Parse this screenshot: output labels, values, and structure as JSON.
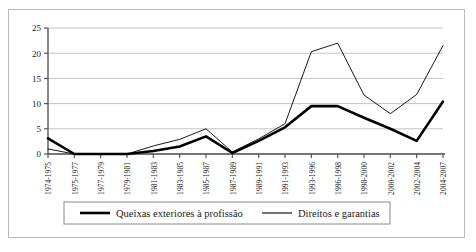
{
  "chart_data": {
    "type": "line",
    "title": "",
    "xlabel": "",
    "ylabel": "",
    "ylim": [
      0,
      25
    ],
    "yticks": [
      0,
      5,
      10,
      15,
      20,
      25
    ],
    "grid": true,
    "legend_position": "bottom",
    "categories": [
      "1974-1975",
      "1975-1977",
      "1977-1979",
      "1979-1981",
      "1981-1983",
      "1983-1985",
      "1985-1987",
      "1987-1989",
      "1989-1991",
      "1991-1993",
      "1993-1996",
      "1996-1998",
      "1998-2000",
      "2000-2002",
      "2002-2004",
      "2004-2007"
    ],
    "series": [
      {
        "name": "Queixas exteriores à profissão",
        "color": "#000000",
        "width": 2.6,
        "values": [
          3.1,
          0,
          0,
          0,
          0.6,
          1.5,
          3.5,
          0.2,
          2.6,
          5.3,
          9.5,
          9.5,
          7.2,
          5.0,
          2.6,
          10.4
        ]
      },
      {
        "name": "Direitos e garantias",
        "color": "#000000",
        "width": 0.9,
        "values": [
          1.0,
          0,
          0,
          0,
          1.6,
          2.9,
          5.0,
          0.4,
          3.0,
          6.0,
          20.3,
          22.0,
          11.7,
          8.0,
          11.8,
          21.5
        ]
      }
    ]
  },
  "legend": {
    "items": [
      {
        "label": "Queixas exteriores à profissão"
      },
      {
        "label": "Direitos e garantias"
      }
    ]
  }
}
